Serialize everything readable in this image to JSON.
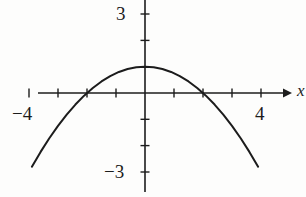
{
  "figure": {
    "width": 306,
    "height": 197,
    "background_color": "#fdfdfc",
    "ink_color": "#1c1c1c"
  },
  "axes": {
    "origin_px": {
      "x": 145,
      "y": 93
    },
    "unit_px": {
      "x": 29,
      "y": 26.3
    },
    "x_axis": {
      "name": "x-axis",
      "label": "x",
      "start_px": 38,
      "end_px": 290,
      "arrow": "right",
      "tick_values": [
        -4,
        -3,
        -2,
        -1,
        1,
        2,
        3,
        4
      ],
      "tick_length_px": 9
    },
    "y_axis": {
      "name": "y-axis",
      "label": "",
      "start_px": 0,
      "end_px": 192,
      "arrow": "none",
      "tick_values": [
        3,
        2,
        1,
        -1,
        -2,
        -3
      ],
      "tick_length_px": 9
    },
    "tick_labels": {
      "x_neg4": "−4",
      "x_4": "4",
      "y_3": "3",
      "y_neg3": "−3"
    }
  },
  "chart_data": {
    "type": "line",
    "title": "",
    "xlabel": "x",
    "ylabel": "",
    "xlim": [
      -4.5,
      4.7
    ],
    "ylim": [
      -3.5,
      3.6
    ],
    "grid": false,
    "legend": false,
    "xticks": [
      -4,
      -3,
      -2,
      -1,
      0,
      1,
      2,
      3,
      4
    ],
    "yticks": [
      -3,
      -2,
      -1,
      0,
      1,
      2,
      3
    ],
    "xtick_labels_shown": [
      "−4",
      "4"
    ],
    "ytick_labels_shown": [
      "3",
      "−3"
    ],
    "series": [
      {
        "name": "parabola",
        "equation": "y = 1 - x^2/4",
        "color": "#1c1c1c",
        "line_width": 2,
        "vertex": [
          0,
          1
        ],
        "roots": [
          -2,
          2
        ],
        "domain": [
          -3.9,
          3.9
        ],
        "x": [
          -3.9,
          -3.6,
          -3.3,
          -3.0,
          -2.7,
          -2.4,
          -2.1,
          -1.8,
          -1.5,
          -1.2,
          -0.9,
          -0.6,
          -0.3,
          0.0,
          0.3,
          0.6,
          0.9,
          1.2,
          1.5,
          1.8,
          2.1,
          2.4,
          2.7,
          3.0,
          3.3,
          3.6,
          3.9
        ],
        "y": [
          -2.8,
          -2.24,
          -1.72,
          -1.25,
          -0.82,
          -0.44,
          -0.1,
          0.19,
          0.44,
          0.64,
          0.8,
          0.91,
          0.98,
          1.0,
          0.98,
          0.91,
          0.8,
          0.64,
          0.44,
          0.19,
          -0.1,
          -0.44,
          -0.82,
          -1.25,
          -1.72,
          -2.24,
          -2.8
        ]
      }
    ]
  }
}
